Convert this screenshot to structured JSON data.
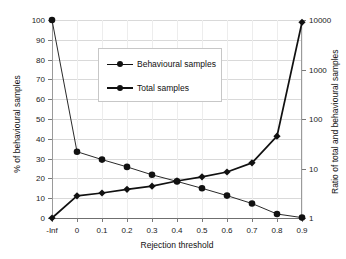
{
  "chart_data": {
    "type": "line",
    "title": "",
    "xlabel": "Rejection threshold",
    "ylabel": "% of behavioural samples",
    "y2label": "Ratio of total and behavioural samples",
    "x": [
      "-Inf",
      "0",
      "0.1",
      "0.2",
      "0.3",
      "0.4",
      "0.5",
      "0.6",
      "0.7",
      "0.8",
      "0.9"
    ],
    "xticklabels": [
      "-Inf",
      "0",
      "0.1",
      "0.2",
      "0.3",
      "0.4",
      "0.5",
      "0.6",
      "0.7",
      "0.8",
      "0.9"
    ],
    "yticklabels": [
      "0",
      "10",
      "20",
      "30",
      "40",
      "50",
      "60",
      "70",
      "80",
      "90",
      "100"
    ],
    "yticks": [
      0,
      10,
      20,
      30,
      40,
      50,
      60,
      70,
      80,
      90,
      100
    ],
    "ylim": [
      0,
      100
    ],
    "y2ticklabels": [
      "1",
      "10",
      "100",
      "1000",
      "10000"
    ],
    "y2ticks": [
      1,
      10,
      100,
      1000,
      10000
    ],
    "y2lim": [
      1,
      10000
    ],
    "y2scale": "log",
    "grid": true,
    "legend_position": "upper-center",
    "series": [
      {
        "name": "Behavioural samples",
        "axis": "left",
        "marker": "circle",
        "values": [
          100,
          33.5,
          29.5,
          25.8,
          21.8,
          18.5,
          15.0,
          11.3,
          7.3,
          2.0,
          0.2
        ]
      },
      {
        "name": "Total samples",
        "axis": "right",
        "marker": "diamond",
        "values": [
          1,
          2.8,
          3.2,
          3.8,
          4.4,
          5.6,
          6.8,
          8.5,
          13,
          45,
          9000
        ]
      }
    ]
  },
  "legend": {
    "entries": [
      {
        "label": "Behavioural samples"
      },
      {
        "label": "Total samples"
      }
    ]
  },
  "axes": {
    "x_title": "Rejection threshold",
    "y_left_title": "% of behavioural samples",
    "y_right_title": "Ratio of total and behavioural samples"
  },
  "colors": {
    "line": "#111111",
    "marker": "#111111",
    "grid": "#d9d9d9",
    "axis": "#7a7a7a",
    "background": "#ffffff"
  }
}
